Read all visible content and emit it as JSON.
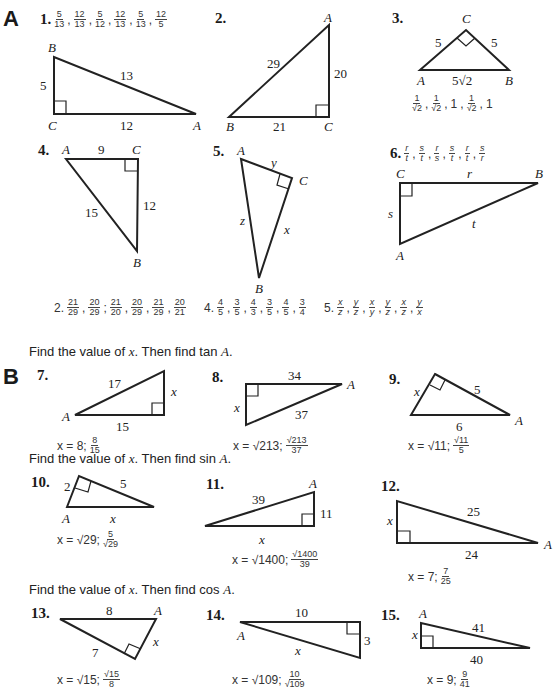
{
  "sections": {
    "A": {
      "label": "A"
    },
    "B": {
      "label": "B"
    }
  },
  "part_a": {
    "p1": {
      "num": "1.",
      "ratios": [
        [
          "5",
          "13"
        ],
        [
          "12",
          "13"
        ],
        [
          "5",
          "12"
        ],
        [
          "12",
          "13"
        ],
        [
          "5",
          "13"
        ],
        [
          "12",
          "5"
        ]
      ],
      "vertices": {
        "B": "B",
        "C": "C",
        "A": "A"
      },
      "sides": {
        "BC": "5",
        "AB": "13",
        "CA": "12"
      }
    },
    "p2": {
      "num": "2.",
      "vertices": {
        "A": "A",
        "B": "B",
        "C": "C"
      },
      "sides": {
        "AB": "29",
        "AC": "20",
        "BC": "21"
      }
    },
    "p3": {
      "num": "3.",
      "vertices": {
        "C": "C",
        "A": "A",
        "B": "B"
      },
      "sides": {
        "AC": "5",
        "BC": "5",
        "AB": "5√2"
      },
      "answer": [
        [
          "1",
          "√2"
        ],
        [
          "1",
          "√2"
        ],
        "1",
        [
          "1",
          "√2"
        ],
        "1"
      ]
    },
    "p4": {
      "num": "4.",
      "vertices": {
        "A": "A",
        "C": "C",
        "B": "B"
      },
      "sides": {
        "AC": "9",
        "CB": "12",
        "AB": "15"
      }
    },
    "p5": {
      "num": "5.",
      "vertices": {
        "A": "A",
        "C": "C",
        "B": "B"
      },
      "sides": {
        "AC": "y",
        "CB": "x",
        "AB": "z"
      }
    },
    "p6": {
      "num": "6.",
      "ratios": [
        [
          "r",
          "t"
        ],
        [
          "s",
          "t"
        ],
        [
          "r",
          "s"
        ],
        [
          "s",
          "t"
        ],
        [
          "r",
          "t"
        ],
        [
          "s",
          "r"
        ]
      ],
      "vertices": {
        "C": "C",
        "B": "B",
        "A": "A"
      },
      "sides": {
        "CB": "r",
        "CA": "s",
        "AB": "t"
      }
    },
    "answers_row": {
      "a2": {
        "num": "2.",
        "ratios": [
          [
            "21",
            "29"
          ],
          [
            "20",
            "29"
          ],
          [
            "21",
            "20"
          ],
          [
            "20",
            "29"
          ],
          [
            "21",
            "29"
          ],
          [
            "20",
            "21"
          ]
        ]
      },
      "a4": {
        "num": "4.",
        "ratios": [
          [
            "4",
            "5"
          ],
          [
            "3",
            "5"
          ],
          [
            "4",
            "3"
          ],
          [
            "3",
            "5"
          ],
          [
            "4",
            "5"
          ],
          [
            "3",
            "4"
          ]
        ]
      },
      "a5": {
        "num": "5.",
        "ratios": [
          [
            "x",
            "z"
          ],
          [
            "y",
            "z"
          ],
          [
            "x",
            "y"
          ],
          [
            "y",
            "z"
          ],
          [
            "x",
            "z"
          ],
          [
            "y",
            "x"
          ]
        ]
      }
    }
  },
  "part_b": {
    "instr_tan": {
      "text": "Find the value of ",
      "var": "x",
      "rest": ".  Then find tan ",
      "end": "A",
      "dot": "."
    },
    "instr_sin": {
      "text": "Find the value of ",
      "var": "x",
      "rest": ".  Then find sin ",
      "end": "A",
      "dot": "."
    },
    "instr_cos": {
      "text": "Find the value of ",
      "var": "x",
      "rest": ".  Then find cos ",
      "end": "A",
      "dot": "."
    },
    "p7": {
      "num": "7.",
      "labels": {
        "hyp": "17",
        "leg": "x",
        "base": "15",
        "A": "A"
      },
      "answer": {
        "x": "x = 8;",
        "frac": [
          "8",
          "15"
        ]
      }
    },
    "p8": {
      "num": "8.",
      "labels": {
        "top": "34",
        "leg": "x",
        "hyp": "37",
        "A": "A"
      },
      "answer": {
        "x": "x = √213;",
        "frac": [
          "√213",
          "37"
        ]
      }
    },
    "p9": {
      "num": "9.",
      "labels": {
        "leg": "x",
        "hyp2": "5",
        "base": "6",
        "A": "A"
      },
      "answer": {
        "x": "x = √11;",
        "frac": [
          "√11",
          "5"
        ]
      }
    },
    "p10": {
      "num": "10.",
      "labels": {
        "leg": "2",
        "hyp2": "5",
        "base": "x",
        "A": "A"
      },
      "answer": {
        "x": "x = √29;",
        "frac": [
          "5",
          "√29"
        ]
      }
    },
    "p11": {
      "num": "11.",
      "labels": {
        "hyp": "39",
        "leg": "11",
        "base": "x",
        "A": "A"
      },
      "answer": {
        "x": "x = √1400;",
        "frac": [
          "√1400",
          "39"
        ]
      }
    },
    "p12": {
      "num": "12.",
      "labels": {
        "leg": "x",
        "hyp": "25",
        "base": "24",
        "A": "A"
      },
      "answer": {
        "x": "x = 7;",
        "frac": [
          "7",
          "25"
        ]
      }
    },
    "p13": {
      "num": "13.",
      "labels": {
        "top": "8",
        "leg": "x",
        "side": "7",
        "A": "A"
      },
      "answer": {
        "x": "x = √15;",
        "frac": [
          "√15",
          "8"
        ]
      }
    },
    "p14": {
      "num": "14.",
      "labels": {
        "top": "10",
        "leg": "3",
        "hyp": "x",
        "A": "A"
      },
      "answer": {
        "x": "x = √109;",
        "frac": [
          "10",
          "√109"
        ]
      }
    },
    "p15": {
      "num": "15.",
      "labels": {
        "leg": "x",
        "hyp": "41",
        "base": "40",
        "A": "A"
      },
      "answer": {
        "x": "x = 9;",
        "frac": [
          "9",
          "41"
        ]
      }
    }
  }
}
